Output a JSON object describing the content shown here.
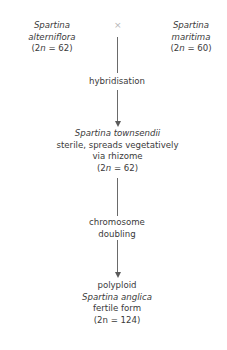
{
  "parents": {
    "left": {
      "genus": "Spartina",
      "species": "alterniflora",
      "chromosome_prefix": "(2",
      "n": "n",
      "chromosome_suffix": " = 62)"
    },
    "right": {
      "genus": "Spartina",
      "species": "maritima",
      "chromosome_prefix": "(2",
      "n": "n",
      "chromosome_suffix": " = 60)"
    },
    "cross_symbol": "×"
  },
  "step1": {
    "label": "hybridisation"
  },
  "hybrid": {
    "name": "Spartina townsendii",
    "line1": "sterile, spreads vegetatively",
    "line2": "via rhizome",
    "chromosome_prefix": "(2",
    "n": "n",
    "chromosome_suffix": " = 62)"
  },
  "step2": {
    "line1": "chromosome",
    "line2": "doubling"
  },
  "result": {
    "line1": "polyploid",
    "name": "Spartina anglica",
    "line3": "fertile form",
    "chromosome": "(2n = 124)"
  }
}
